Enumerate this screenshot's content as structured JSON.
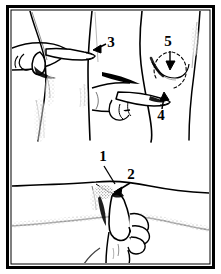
{
  "figure": {
    "style": "line-art-engraving",
    "background_color": "#ffffff",
    "ink_color": "#000000",
    "frame": {
      "outer_color": "#000000",
      "inner_color": "#ffffff",
      "outer_width": 3,
      "inset": 6
    }
  },
  "panels": [
    {
      "id": "upper-panel",
      "name": "upper-limb-examination",
      "region": "top",
      "subjects": [
        {
          "id": "left-limb",
          "name": "left-leg-contour"
        },
        {
          "id": "center-limb",
          "name": "center-leg-contour"
        },
        {
          "id": "right-limb",
          "name": "right-leg-contour"
        }
      ],
      "hands": [
        {
          "id": "hand-upper-left",
          "name": "examining-hand-pointing-right",
          "position": "upper-left"
        },
        {
          "id": "hand-middle",
          "name": "examining-hand-pointing-right",
          "position": "middle-center"
        }
      ]
    },
    {
      "id": "lower-panel",
      "name": "lower-limb-examination",
      "region": "bottom",
      "subjects": [
        {
          "id": "horizontal-limb",
          "name": "horizontal-forearm-contour"
        }
      ],
      "hands": [
        {
          "id": "hand-lower",
          "name": "examining-hand-index-finger-up",
          "position": "bottom-center"
        }
      ]
    }
  ],
  "callouts": [
    {
      "id": "c1",
      "label": "1",
      "x": 103,
      "y": 161,
      "leader": {
        "type": "line",
        "x1": 104,
        "y1": 165,
        "x2": 115,
        "y2": 183
      },
      "panel": "lower-panel"
    },
    {
      "id": "c2",
      "label": "2",
      "x": 131,
      "y": 179,
      "leader": {
        "type": "arrow",
        "x1": 130,
        "y1": 182,
        "x2": 117,
        "y2": 191
      },
      "panel": "lower-panel"
    },
    {
      "id": "c3",
      "label": "3",
      "x": 111,
      "y": 46,
      "leader": {
        "type": "arrow",
        "x1": 108,
        "y1": 44,
        "x2": 95,
        "y2": 50
      },
      "panel": "upper-panel"
    },
    {
      "id": "c4",
      "label": "4",
      "x": 161,
      "y": 114,
      "leader": {
        "type": "arrow",
        "x1": 162,
        "y1": 110,
        "x2": 164,
        "y2": 95
      },
      "panel": "upper-panel"
    },
    {
      "id": "c5",
      "label": "5",
      "x": 168,
      "y": 45,
      "leader": {
        "type": "arrow",
        "x1": 170,
        "y1": 49,
        "x2": 170,
        "y2": 66
      },
      "panel": "upper-panel"
    }
  ],
  "annotations": {
    "dashed_arc": {
      "name": "range-of-motion-arc",
      "description": "dashed arc indicating motion range near callout 5",
      "center_x": 170,
      "center_y": 70,
      "radius": 18
    }
  }
}
